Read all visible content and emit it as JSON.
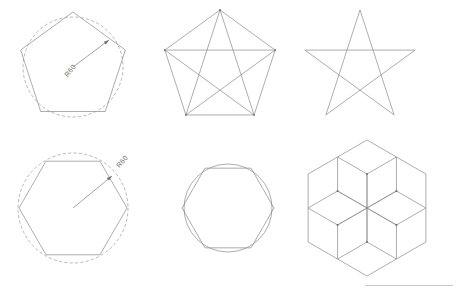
{
  "sheet": {
    "title": "Geometric Construction Worksheet",
    "width": 457,
    "height": 295,
    "background_color": "#ffffff",
    "line_color": "#8a8a8a",
    "dimension_text_color": "#6f6f6f"
  },
  "figures": [
    {
      "id": "pentagon-in-circle",
      "name": "Regular pentagon circumscribed about dashed construction circle",
      "row": 1,
      "column": 1,
      "center": [
        73,
        67
      ],
      "radius": 55,
      "sides": 5,
      "has_construction_circle": true,
      "construction_circle_style": "dashed",
      "construction_circle_radius": 50,
      "dimension": {
        "label": "R60",
        "type": "radius",
        "value": 60,
        "prefix": "R",
        "text_x": 72,
        "text_y": 72,
        "rotation": -52,
        "leader_from": [
          73,
          67
        ],
        "leader_to": [
          109,
          40
        ]
      }
    },
    {
      "id": "pentagon-with-diagonals",
      "name": "Regular pentagon with all diagonals forming inscribed pentagram",
      "row": 1,
      "column": 2,
      "center": [
        220,
        68
      ],
      "radius": 58,
      "sides": 5,
      "has_construction_circle": false,
      "draw_diagonals": true,
      "dimension": null
    },
    {
      "id": "pentagram-star",
      "name": "Five-pointed star outline (pentagram)",
      "row": 1,
      "column": 3,
      "center": [
        360,
        68
      ],
      "radius": 58,
      "points": 5,
      "has_construction_circle": false,
      "dimension": null
    },
    {
      "id": "hexagon-in-circle",
      "name": "Regular hexagon inscribed in dashed construction circle",
      "row": 2,
      "column": 1,
      "center": [
        73,
        208
      ],
      "radius": 54,
      "sides": 6,
      "has_construction_circle": true,
      "construction_circle_style": "dashed",
      "construction_circle_radius": 55,
      "dimension": {
        "label": "R60",
        "type": "radius",
        "value": 60,
        "prefix": "R",
        "text_x": 124,
        "text_y": 163,
        "rotation": -50,
        "leader_from": [
          73,
          208
        ],
        "leader_to": [
          112,
          176
        ]
      }
    },
    {
      "id": "hexagon-with-circle",
      "name": "Regular hexagon with coincident circumscribing circle",
      "row": 2,
      "column": 2,
      "center": [
        228,
        208
      ],
      "radius": 46,
      "sides": 6,
      "has_construction_circle": true,
      "construction_circle_style": "solid",
      "construction_circle_radius": 44,
      "dimension": null
    },
    {
      "id": "hexagon-rosette",
      "name": "Rosette of six overlapping hexagons around central hexagonal void",
      "row": 2,
      "column": 3,
      "center": [
        367,
        208
      ],
      "hexagon_radius": 34,
      "ring_count": 6,
      "ring_offset": 34,
      "has_construction_circle": false,
      "dimension": null
    }
  ],
  "annotations": {
    "border_rule": {
      "name": "title-block-rule",
      "x": 365,
      "y": 285,
      "width": 88,
      "color": "#c9c9c9"
    }
  }
}
